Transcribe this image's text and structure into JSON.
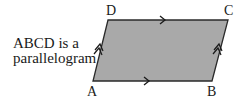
{
  "caption": {
    "line1": "ABCD is a",
    "line2": "parallelogram"
  },
  "shape": {
    "type": "parallelogram",
    "fill_color": "#a9a9a9",
    "stroke_color": "#2a2a2a",
    "vertices": {
      "A": {
        "label": "A",
        "x": 93,
        "y": 81
      },
      "B": {
        "label": "B",
        "x": 212,
        "y": 81
      },
      "C": {
        "label": "C",
        "x": 228,
        "y": 20
      },
      "D": {
        "label": "D",
        "x": 108,
        "y": 20
      }
    },
    "markings": {
      "AB": "single-arrow",
      "DC": "single-arrow",
      "AD": "double-arrow",
      "BC": "double-arrow"
    }
  }
}
